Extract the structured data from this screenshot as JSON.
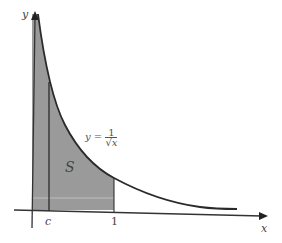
{
  "figure": {
    "axis_x_label": "x",
    "axis_y_label": "y",
    "region_label": "S",
    "tick_c": "c",
    "tick_one": "1",
    "curve_label": {
      "lhs": "y =",
      "numerator": "1",
      "denominator": "√x"
    },
    "colors": {
      "shade": "#9a9a9a",
      "curve": "#2a2a2a",
      "axis": "#333333"
    }
  }
}
